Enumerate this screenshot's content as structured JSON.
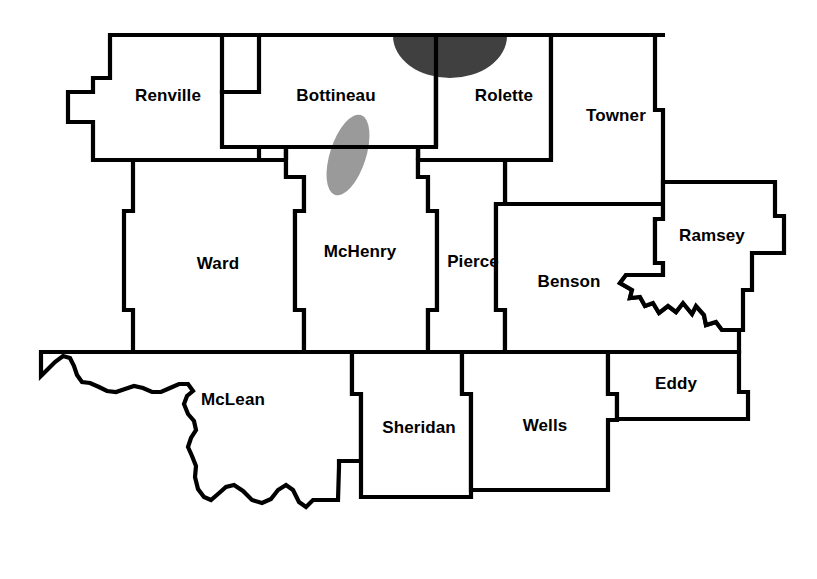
{
  "map": {
    "title": "North Dakota counties outline map",
    "region": "North-central North Dakota",
    "background_color": "#ffffff",
    "border_color": "#000000",
    "label_color": "#000000",
    "counties": [
      {
        "id": "renville",
        "label": "Renville",
        "label_x": 168,
        "label_y": 97
      },
      {
        "id": "bottineau",
        "label": "Bottineau",
        "label_x": 336,
        "label_y": 97
      },
      {
        "id": "rolette",
        "label": "Rolette",
        "label_x": 504,
        "label_y": 97
      },
      {
        "id": "towner",
        "label": "Towner",
        "label_x": 616,
        "label_y": 117
      },
      {
        "id": "ward",
        "label": "Ward",
        "label_x": 218,
        "label_y": 265
      },
      {
        "id": "mchenry",
        "label": "McHenry",
        "label_x": 360,
        "label_y": 253
      },
      {
        "id": "pierce",
        "label": "Pierce",
        "label_x": 473,
        "label_y": 263
      },
      {
        "id": "benson",
        "label": "Benson",
        "label_x": 569,
        "label_y": 283
      },
      {
        "id": "ramsey",
        "label": "Ramsey",
        "label_x": 712,
        "label_y": 237
      },
      {
        "id": "mclean",
        "label": "McLean",
        "label_x": 233,
        "label_y": 401
      },
      {
        "id": "sheridan",
        "label": "Sheridan",
        "label_x": 419,
        "label_y": 429
      },
      {
        "id": "wells",
        "label": "Wells",
        "label_x": 545,
        "label_y": 427
      },
      {
        "id": "eddy",
        "label": "Eddy",
        "label_x": 676,
        "label_y": 385
      }
    ],
    "shaded_areas": [
      {
        "id": "dark-blob",
        "name": "dark-shaded-area",
        "color": "#404040",
        "description": "dark shaded half-ellipse straddling the Bottineau / Rolette boundary at the northern border",
        "cx": 450,
        "cy": 36,
        "rx": 57,
        "ry": 42
      },
      {
        "id": "light-blob",
        "name": "light-shaded-area",
        "color": "#9a9a9a",
        "description": "light gray elongated oval straddling the Bottineau / McHenry boundary",
        "cx": 348,
        "cy": 155,
        "rx": 18,
        "ry": 42,
        "rotation": 18
      }
    ]
  }
}
